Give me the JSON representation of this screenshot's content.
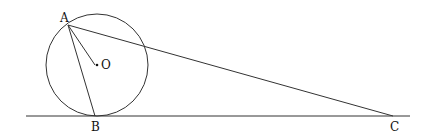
{
  "diagram": {
    "type": "geometry",
    "points": {
      "A": {
        "label": "A",
        "x": 68,
        "y": 25
      },
      "O": {
        "label": "O",
        "x": 97,
        "y": 65
      },
      "B": {
        "label": "B",
        "x": 95,
        "y": 116
      },
      "C": {
        "label": "C",
        "x": 393,
        "y": 116
      }
    },
    "circle": {
      "center": "O",
      "cx": 97,
      "cy": 65,
      "r": 51
    },
    "segments": [
      "AB",
      "AO",
      "AC"
    ],
    "tangent_line": {
      "x1": 26,
      "y1": 116,
      "x2": 410,
      "y2": 116
    },
    "colors": {
      "stroke": "#333333",
      "text": "#111111"
    }
  }
}
